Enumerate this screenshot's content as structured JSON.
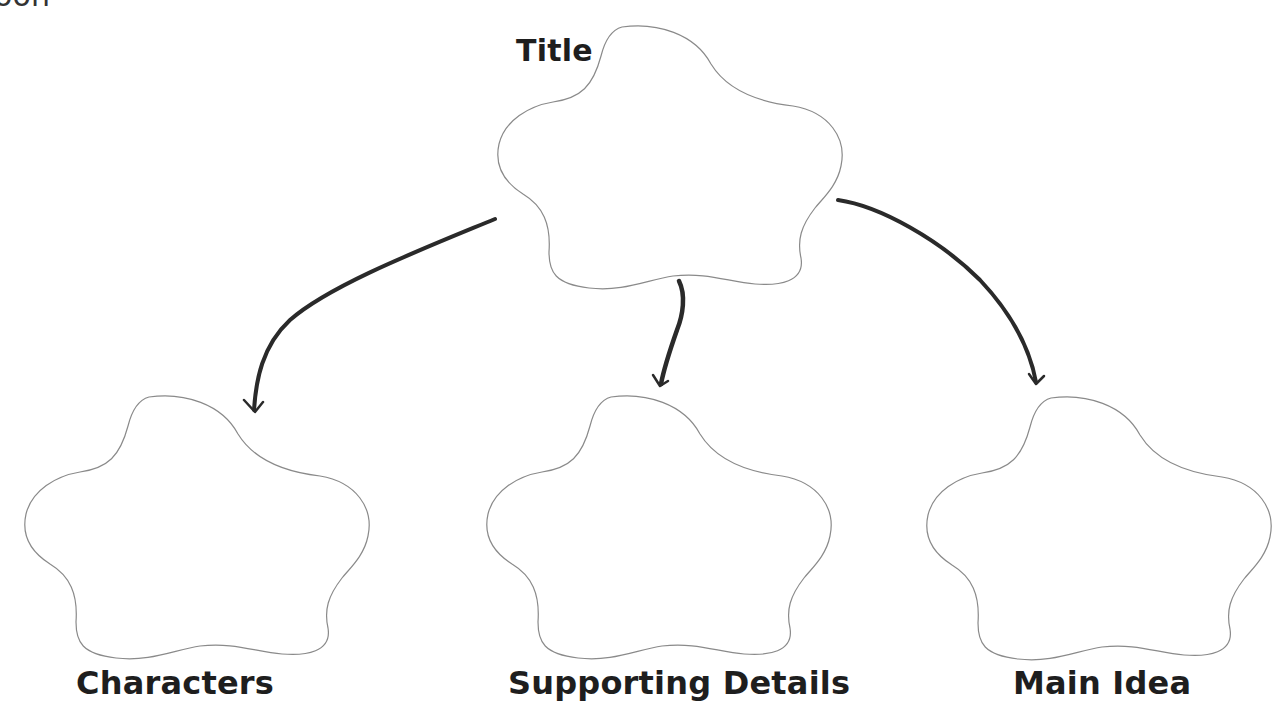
{
  "page": {
    "cut_off_text": "oon"
  },
  "diagram": {
    "type": "graphic-organizer",
    "nodes": [
      {
        "id": "title",
        "label": "Title",
        "shape": "flower-5-lobe"
      },
      {
        "id": "characters",
        "label": "Characters",
        "shape": "flower-5-lobe"
      },
      {
        "id": "supporting-details",
        "label": "Supporting Details",
        "shape": "flower-5-lobe"
      },
      {
        "id": "main-idea",
        "label": "Main Idea",
        "shape": "flower-5-lobe"
      }
    ],
    "edges": [
      {
        "from": "title",
        "to": "characters",
        "style": "hand-drawn-arrow"
      },
      {
        "from": "title",
        "to": "supporting-details",
        "style": "hand-drawn-arrow"
      },
      {
        "from": "title",
        "to": "main-idea",
        "style": "hand-drawn-arrow"
      }
    ],
    "colors": {
      "outline": "#8a8a8a",
      "arrow": "#2a2a2a",
      "text": "#1e1e1e",
      "background": "#ffffff"
    }
  }
}
